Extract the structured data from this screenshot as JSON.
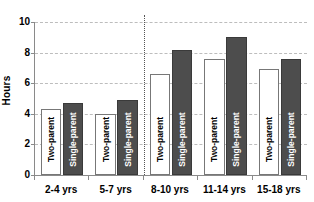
{
  "chart_data": {
    "type": "bar",
    "title": "",
    "xlabel": "",
    "ylabel": "Hours",
    "ylim": [
      0,
      10
    ],
    "yticks": [
      0,
      2,
      4,
      6,
      8,
      10
    ],
    "ytick_labels": [
      "0",
      "2",
      "4",
      "6",
      "8",
      "10"
    ],
    "grid": true,
    "legend": "none",
    "categories": [
      "2-4 yrs",
      "5-7 yrs",
      "8-10 yrs",
      "11-14 yrs",
      "15-18 yrs"
    ],
    "series": [
      {
        "name": "Two-parent",
        "values": [
          4.3,
          4.0,
          6.6,
          7.6,
          6.9
        ],
        "color": "#ffffff",
        "border_color": "#777777",
        "label_color": "#000000"
      },
      {
        "name": "Single-parent",
        "values": [
          4.7,
          4.9,
          8.2,
          9.0,
          7.6
        ],
        "color": "#4d4d4d",
        "border_color": "#3a3a3a",
        "label_color": "#ffffff"
      }
    ],
    "annotations": [
      {
        "type": "vertical-divider",
        "style": "dotted",
        "after_category": "5-7 yrs"
      }
    ],
    "axis_color": "#8a8a8a",
    "gridline_color": "#bdbdbd",
    "background": "#ffffff"
  }
}
